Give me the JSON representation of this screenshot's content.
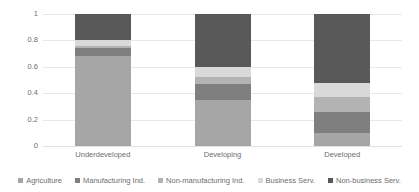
{
  "chart_data": {
    "type": "bar",
    "subtype": "stacked-bar-100percent",
    "title": "",
    "xlabel": "",
    "ylabel": "",
    "ylim": [
      0,
      1
    ],
    "ytick_labels": [
      "1",
      "0.8",
      "0.6",
      "0.4",
      "0.2",
      "0"
    ],
    "ytick_values": [
      1,
      0.8,
      0.6,
      0.4,
      0.2,
      0
    ],
    "grid": true,
    "legend_position": "bottom",
    "categories": [
      "Underdeveloped",
      "Developing",
      "Developed"
    ],
    "series": [
      {
        "name": "Agriculture",
        "color": "#a6a6a6",
        "values": [
          0.68,
          0.345,
          0.095
        ]
      },
      {
        "name": "Manufacturing Ind.",
        "color": "#7f7f7f",
        "values": [
          0.065,
          0.125,
          0.16
        ]
      },
      {
        "name": "Non-manufacturing Ind.",
        "color": "#b3b3b3",
        "values": [
          0.01,
          0.055,
          0.12
        ]
      },
      {
        "name": "Business Serv.",
        "color": "#d9d9d9",
        "values": [
          0.045,
          0.075,
          0.1
        ]
      },
      {
        "name": "Non-business Serv.",
        "color": "#595959",
        "values": [
          0.2,
          0.4,
          0.525
        ]
      }
    ]
  },
  "legend": {
    "items": [
      {
        "label": "Agriculture",
        "color": "#a6a6a6"
      },
      {
        "label": "Manufacturing Ind.",
        "color": "#7f7f7f"
      },
      {
        "label": "Non-manufacturing Ind.",
        "color": "#b3b3b3"
      },
      {
        "label": "Business Serv.",
        "color": "#d9d9d9"
      },
      {
        "label": "Non-business Serv.",
        "color": "#595959"
      }
    ]
  },
  "style": {
    "background": "#ffffff",
    "gridline_color": "#e8e8e8",
    "text_color": "#6e6e6e"
  }
}
